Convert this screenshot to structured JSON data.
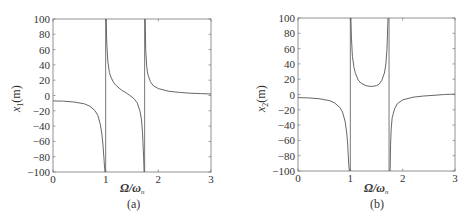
{
  "chart_data": [
    {
      "type": "line",
      "panel_label": "(a)",
      "title": "",
      "xlabel": "Ω/ωₙ",
      "ylabel": "x₁(m)",
      "xlim": [
        0,
        3
      ],
      "ylim": [
        -100,
        100
      ],
      "xticks": [
        "0",
        "1",
        "2",
        "3"
      ],
      "yticks": [
        "100",
        "80",
        "60",
        "40",
        "20",
        "0",
        "-20",
        "-40",
        "-60",
        "-80",
        "-100"
      ],
      "grid": false,
      "asymptotes": [
        1.0,
        1.74
      ],
      "series": [
        {
          "name": "x1",
          "segments": [
            {
              "x": [
                0,
                0.2,
                0.4,
                0.6,
                0.7,
                0.8,
                0.85,
                0.9,
                0.93,
                0.95,
                0.97,
                0.98,
                0.99
              ],
              "y": [
                -7,
                -7.5,
                -8.5,
                -11,
                -14,
                -20,
                -26,
                -38,
                -52,
                -65,
                -85,
                -95,
                -100
              ]
            },
            {
              "x": [
                1.01,
                1.02,
                1.04,
                1.07,
                1.1,
                1.15,
                1.2,
                1.3,
                1.4,
                1.5,
                1.55,
                1.6,
                1.65,
                1.68,
                1.7,
                1.72,
                1.73
              ],
              "y": [
                100,
                70,
                45,
                30,
                24,
                17,
                13,
                7,
                3,
                -2,
                -5,
                -10,
                -20,
                -32,
                -48,
                -80,
                -100
              ]
            },
            {
              "x": [
                1.75,
                1.76,
                1.78,
                1.8,
                1.85,
                1.9,
                2.0,
                2.2,
                2.4,
                2.6,
                2.8,
                3.0
              ],
              "y": [
                100,
                60,
                38,
                28,
                18,
                13,
                9,
                5.5,
                4,
                3,
                2.5,
                2
              ]
            }
          ]
        }
      ]
    },
    {
      "type": "line",
      "panel_label": "(b)",
      "title": "",
      "xlabel": "Ω/ωₙ",
      "ylabel": "x₂(m)",
      "xlim": [
        0,
        3
      ],
      "ylim": [
        -100,
        100
      ],
      "xticks": [
        "0",
        "1",
        "2",
        "3"
      ],
      "yticks": [
        "100",
        "80",
        "60",
        "40",
        "20",
        "0",
        "-20",
        "-40",
        "-60",
        "-80",
        "-100"
      ],
      "grid": false,
      "asymptotes": [
        1.0,
        1.74
      ],
      "series": [
        {
          "name": "x2",
          "segments": [
            {
              "x": [
                0,
                0.2,
                0.4,
                0.6,
                0.7,
                0.8,
                0.85,
                0.9,
                0.93,
                0.95,
                0.96,
                0.97,
                0.98
              ],
              "y": [
                -4,
                -4.5,
                -5.5,
                -8,
                -11,
                -17,
                -23,
                -35,
                -50,
                -65,
                -78,
                -92,
                -100
              ]
            },
            {
              "x": [
                1.01,
                1.02,
                1.04,
                1.07,
                1.1,
                1.15,
                1.2,
                1.3,
                1.4,
                1.5,
                1.55,
                1.6,
                1.65,
                1.68,
                1.7,
                1.72
              ],
              "y": [
                100,
                75,
                50,
                35,
                27,
                19,
                15,
                11.5,
                10.5,
                11.5,
                13.5,
                18,
                28,
                40,
                60,
                100
              ]
            },
            {
              "x": [
                1.76,
                1.77,
                1.78,
                1.8,
                1.85,
                1.9,
                2.0,
                2.2,
                2.4,
                2.6,
                2.8,
                3.0
              ],
              "y": [
                -100,
                -65,
                -45,
                -30,
                -18,
                -12,
                -7,
                -3.5,
                -2,
                -1,
                0,
                0.5
              ]
            }
          ]
        }
      ]
    }
  ],
  "panels": {
    "a": {
      "caption": "(a)",
      "ylabel_main": "x",
      "ylabel_sub": "1",
      "ylabel_unit": "(m)",
      "xlabel_main": "Ω/ω",
      "xlabel_sub": "n"
    },
    "b": {
      "caption": "(b)",
      "ylabel_main": "x",
      "ylabel_sub": "2",
      "ylabel_unit": "(m)",
      "xlabel_main": "Ω/ω",
      "xlabel_sub": "n"
    }
  },
  "style": {
    "line_color": "#555555",
    "axis_color": "#666666",
    "text_color": "#333333"
  }
}
